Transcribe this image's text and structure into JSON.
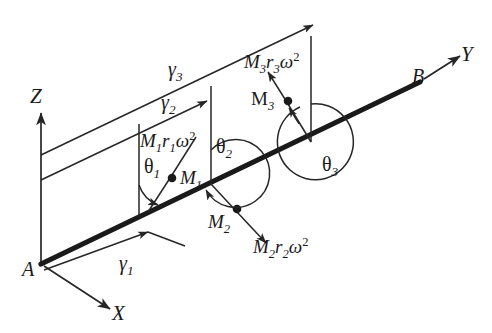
{
  "figure": {
    "type": "engineering-diagram",
    "stroke_color": "#262626",
    "shaft_color": "#1a1a1a",
    "background": "#ffffff"
  },
  "axes": {
    "x": {
      "label": "X"
    },
    "y": {
      "label": "Y"
    },
    "z": {
      "label": "Z"
    }
  },
  "shaft": {
    "start_label": "A",
    "end_label": "B"
  },
  "distances": [
    {
      "id": "gamma1",
      "label_base": "γ",
      "label_sub": "1"
    },
    {
      "id": "gamma2",
      "label_base": "γ",
      "label_sub": "2"
    },
    {
      "id": "gamma3",
      "label_base": "γ",
      "label_sub": "3"
    }
  ],
  "masses": [
    {
      "id": "m1",
      "label_base": "M",
      "label_sub": "1"
    },
    {
      "id": "m2",
      "label_base": "M",
      "label_sub": "2"
    },
    {
      "id": "m3",
      "label_base": "M",
      "label_sub": "3"
    }
  ],
  "forces": [
    {
      "id": "f1",
      "m": "M",
      "m_sub": "1",
      "r": "r",
      "r_sub": "1",
      "omega": "ω",
      "exp": "2"
    },
    {
      "id": "f2",
      "m": "M",
      "m_sub": "2",
      "r": "r",
      "r_sub": "2",
      "omega": "ω",
      "exp": "2"
    },
    {
      "id": "f3",
      "m": "M",
      "m_sub": "3",
      "r": "r",
      "r_sub": "3",
      "omega": "ω",
      "exp": "2"
    }
  ],
  "angles": [
    {
      "id": "theta1",
      "label_base": "θ",
      "label_sub": "1"
    },
    {
      "id": "theta2",
      "label_base": "θ",
      "label_sub": "2"
    },
    {
      "id": "theta3",
      "label_base": "θ",
      "label_sub": "3"
    }
  ]
}
